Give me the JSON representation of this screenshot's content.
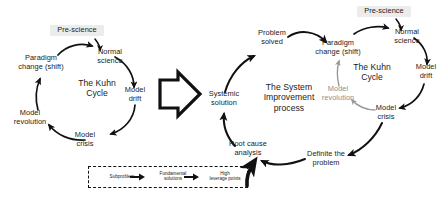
{
  "diagram": {
    "title_left": "The Kuhn Cycle",
    "title_right_process": "The System\nImprovement\nprocess",
    "title_right_kuhn": "The Kuhn\nCycle",
    "transition_icon": "block-arrow-right-icon"
  },
  "kuhn_left": {
    "center": "The Kuhn\nCycle",
    "nodes": [
      {
        "id": "pre_science",
        "label": "Pre-science",
        "highlight": "#ececec"
      },
      {
        "id": "normal_science",
        "label": "Normal\nscience"
      },
      {
        "id": "model_drift",
        "label": "Model\ndrift"
      },
      {
        "id": "model_crisis",
        "label": "Model\ncrisis"
      },
      {
        "id": "model_revolution",
        "label": "Model\nrevolution"
      },
      {
        "id": "paradigm_change",
        "label": "Paradigm\nchange (shift)"
      }
    ]
  },
  "kuhn_right": {
    "center": "The Kuhn\nCycle",
    "nodes": [
      {
        "id": "pre_science",
        "label": "Pre-science",
        "highlight": "#ececec"
      },
      {
        "id": "normal_science",
        "label": "Normal\nscience"
      },
      {
        "id": "model_drift",
        "label": "Model\ndrift"
      },
      {
        "id": "model_crisis",
        "label": "Model\ncrisis"
      },
      {
        "id": "model_revolution",
        "label": "Model\nrevolution",
        "faded": true
      },
      {
        "id": "paradigm_change",
        "label": "Paradigm\nchange (shift)"
      }
    ]
  },
  "sip": {
    "center": "The System\nImprovement\nprocess",
    "nodes": [
      {
        "id": "problem_solved",
        "label": "Problem\nsolved"
      },
      {
        "id": "systemic_solution",
        "label": "Systemic\nsolution"
      },
      {
        "id": "root_cause_analysis",
        "label": "Root cause\nanalysis"
      },
      {
        "id": "definite_the_problem",
        "label": "Definite the\nproblem"
      }
    ]
  },
  "legend": {
    "items": [
      {
        "id": "subproblem",
        "label": "Subproblem"
      },
      {
        "id": "fundamental_solutions",
        "label": "Fundamental\nsolutions"
      },
      {
        "id": "high_leverage_points",
        "label": "High\nleverage points"
      }
    ],
    "connector_icons": [
      "arrow-right-icon",
      "arrow-right-icon"
    ],
    "border_style": "dashed"
  },
  "colors": {
    "stroke": "#111111",
    "faded_stroke": "#9a9a9a",
    "highlight": "#ececec",
    "text": "#1a1a1a",
    "background": "#ffffff"
  }
}
